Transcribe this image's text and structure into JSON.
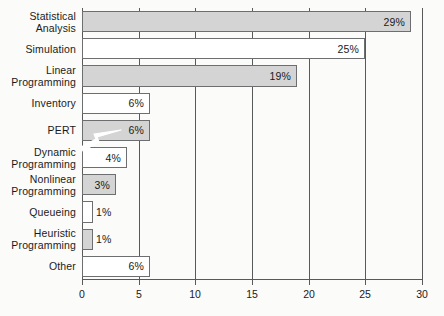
{
  "chart_data": {
    "type": "bar",
    "orientation": "horizontal",
    "title": "",
    "subtitle": "",
    "xlabel": "",
    "ylabel": "",
    "xlim": [
      0,
      30
    ],
    "xticks": [
      0,
      5,
      10,
      15,
      20,
      25,
      30
    ],
    "xtick_labels": [
      "0",
      "5",
      "10",
      "15",
      "20",
      "25",
      "30"
    ],
    "grid": true,
    "grid_axis": "x",
    "legend": "none",
    "categories": [
      "Statistical Analysis",
      "Simulation",
      "Linear Programming",
      "Inventory",
      "PERT",
      "Dynamic Programming",
      "Nonlinear Programming",
      "Queueing",
      "Heuristic Programming",
      "Other"
    ],
    "values": [
      29,
      25,
      19,
      6,
      6,
      4,
      3,
      1,
      1,
      6
    ],
    "data_labels": [
      "29%",
      "25%",
      "19%",
      "6%",
      "6%",
      "4%",
      "3%",
      "1%",
      "1%",
      "6%"
    ],
    "bar_fills": [
      "gray",
      "white",
      "gray",
      "white",
      "gray",
      "white",
      "gray",
      "white",
      "gray",
      "white"
    ],
    "annotations": [
      {
        "name": "pointer-arrow",
        "target_category": "PERT",
        "shape": "arrow",
        "color": "#ffffff"
      }
    ]
  },
  "colors": {
    "background": "#fbfbfa",
    "bar_gray": "#d4d4d4",
    "bar_white": "#ffffff",
    "bar_outline": "#6d6e70",
    "axis": "#58595b",
    "text": "#1a1a1a",
    "annotation": "#ffffff"
  },
  "rows": [
    {
      "label_lines": [
        "Statistical",
        "Analysis"
      ],
      "value": 29,
      "data_label": "29%",
      "fill": "gray"
    },
    {
      "label_lines": [
        "Simulation"
      ],
      "value": 25,
      "data_label": "25%",
      "fill": "white"
    },
    {
      "label_lines": [
        "Linear",
        "Programming"
      ],
      "value": 19,
      "data_label": "19%",
      "fill": "gray"
    },
    {
      "label_lines": [
        "Inventory"
      ],
      "value": 6,
      "data_label": "6%",
      "fill": "white"
    },
    {
      "label_lines": [
        "PERT"
      ],
      "value": 6,
      "data_label": "6%",
      "fill": "gray"
    },
    {
      "label_lines": [
        "Dynamic",
        "Programming"
      ],
      "value": 4,
      "data_label": "4%",
      "fill": "white"
    },
    {
      "label_lines": [
        "Nonlinear",
        "Programming"
      ],
      "value": 3,
      "data_label": "3%",
      "fill": "gray"
    },
    {
      "label_lines": [
        "Queueing"
      ],
      "value": 1,
      "data_label": "1%",
      "fill": "white"
    },
    {
      "label_lines": [
        "Heuristic",
        "Programming"
      ],
      "value": 1,
      "data_label": "1%",
      "fill": "gray"
    },
    {
      "label_lines": [
        "Other"
      ],
      "value": 6,
      "data_label": "6%",
      "fill": "white"
    }
  ],
  "xaxis": {
    "ticks": [
      {
        "value": 0,
        "label": "0"
      },
      {
        "value": 5,
        "label": "5"
      },
      {
        "value": 10,
        "label": "10"
      },
      {
        "value": 15,
        "label": "15"
      },
      {
        "value": 20,
        "label": "20"
      },
      {
        "value": 25,
        "label": "25"
      },
      {
        "value": 30,
        "label": "30"
      }
    ]
  }
}
